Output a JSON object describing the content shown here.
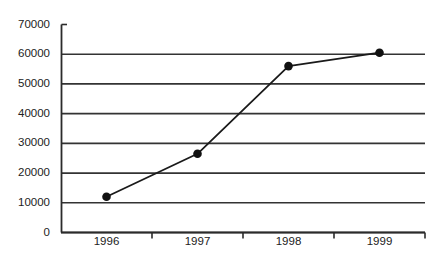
{
  "chart_data": {
    "type": "line",
    "title": "",
    "xlabel": "",
    "ylabel": "",
    "categories": [
      "1996",
      "1997",
      "1998",
      "1999"
    ],
    "values": [
      12000,
      26500,
      56000,
      60500
    ],
    "series": [
      {
        "name": "series-1",
        "values": [
          12000,
          26500,
          56000,
          60500
        ]
      }
    ],
    "ylim": [
      0,
      70000
    ],
    "yticks": [
      0,
      10000,
      20000,
      30000,
      40000,
      50000,
      60000,
      70000
    ],
    "ytick_labels": [
      "0",
      "10000",
      "20000",
      "30000",
      "40000",
      "50000",
      "60000",
      "70000"
    ],
    "gridlines": [
      0,
      10000,
      20000,
      30000,
      40000,
      50000,
      60000
    ],
    "grid": true,
    "legend": null,
    "legend_position": "none",
    "marker": "filled-circle",
    "line_color": "#1a1a1a",
    "marker_color": "#111111",
    "grid_color": "#333333",
    "axis_color": "#2b2b2b",
    "background_color": "#ffffff"
  }
}
